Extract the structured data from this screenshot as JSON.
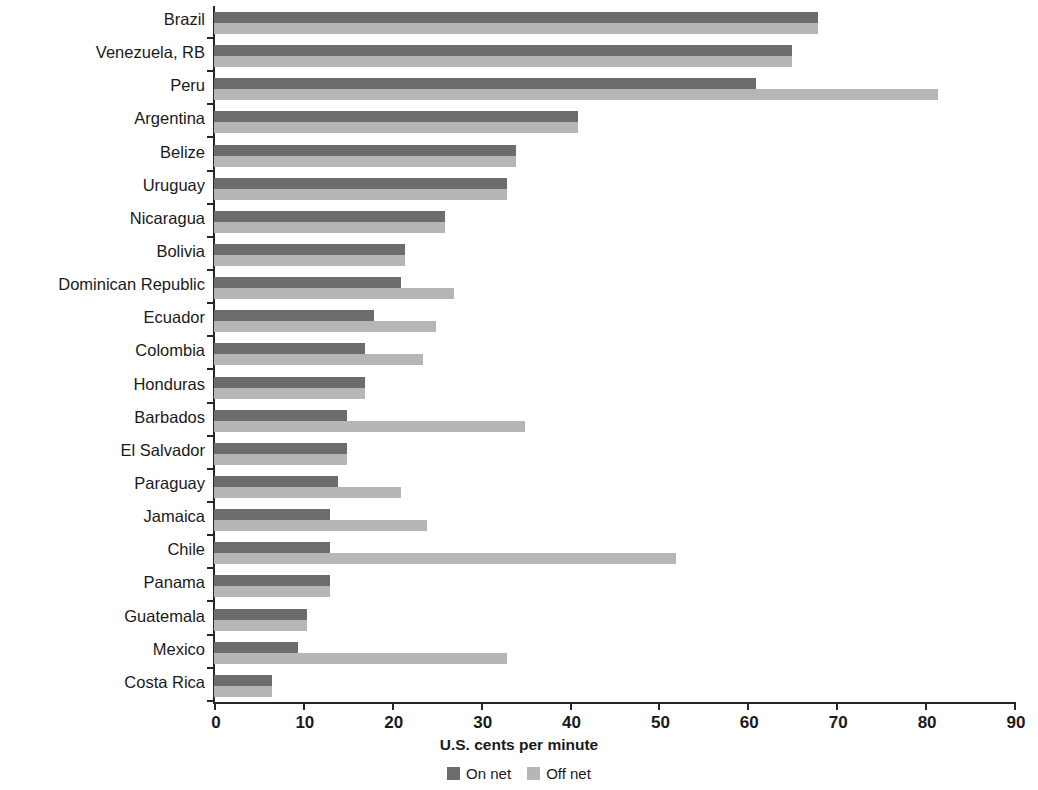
{
  "chart_data": {
    "type": "bar",
    "orientation": "horizontal",
    "title": "",
    "xlabel": "U.S. cents per minute",
    "ylabel": "Country",
    "xlim": [
      0,
      90
    ],
    "xticks": [
      0,
      10,
      20,
      30,
      40,
      50,
      60,
      70,
      80,
      90
    ],
    "grid": false,
    "legend_position": "bottom",
    "categories": [
      "Brazil",
      "Venezuela, RB",
      "Peru",
      "Argentina",
      "Belize",
      "Uruguay",
      "Nicaragua",
      "Bolivia",
      "Dominican Republic",
      "Ecuador",
      "Colombia",
      "Honduras",
      "Barbados",
      "El Salvador",
      "Paraguay",
      "Jamaica",
      "Chile",
      "Panama",
      "Guatemala",
      "Mexico",
      "Costa Rica"
    ],
    "series": [
      {
        "name": "On net",
        "color": "#6c6c6c",
        "values": [
          68,
          65,
          61,
          41,
          34,
          33,
          26,
          21.5,
          21,
          18,
          17,
          17,
          15,
          15,
          14,
          13,
          13,
          13,
          10.5,
          9.5,
          6.5
        ]
      },
      {
        "name": "Off net",
        "color": "#b6b6b6",
        "values": [
          68,
          65,
          81.5,
          41,
          34,
          33,
          26,
          21.5,
          27,
          25,
          23.5,
          17,
          35,
          15,
          21,
          24,
          52,
          13,
          10.5,
          33,
          6.5
        ]
      }
    ]
  },
  "legend": {
    "items": [
      {
        "label": "On net",
        "color": "#6c6c6c"
      },
      {
        "label": "Off net",
        "color": "#b6b6b6"
      }
    ]
  }
}
